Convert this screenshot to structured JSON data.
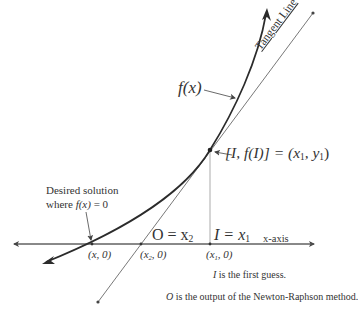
{
  "diagram": {
    "colors": {
      "curve": "#2b2b2b",
      "tangent": "#555555",
      "axis": "#444444",
      "text": "#333333"
    },
    "labels": {
      "curve_label": "f(x)",
      "tangent_label": "Tangent Line",
      "point_label_prefix": "[I, f(I)] = (x",
      "point_label_sub1": "1",
      "point_label_mid": ", y",
      "point_label_sub2": "1",
      "point_label_suffix": ")",
      "desired_line1": "Desired solution",
      "desired_line2_prefix": "where ",
      "desired_line2_fx": "f(x)",
      "desired_line2_suffix": " = 0",
      "o_label": "O = x",
      "o_sub": "2",
      "i_label": "I = x",
      "i_sub": "1",
      "x_axis_label": "x-axis",
      "root_coord": "(x, 0)",
      "x2_coord_prefix": "(x",
      "x2_coord_sub": "2",
      "x2_coord_suffix": ", 0)",
      "x1_coord_prefix": "(x",
      "x1_coord_sub": "1",
      "x1_coord_suffix": ", 0)",
      "note1_var": "I",
      "note1_text": " is the first guess.",
      "note2_var": "O",
      "note2_text": " is the output of the Newton-Raphson method."
    },
    "geometry": {
      "x_axis_y": 244,
      "x_axis_from": 12,
      "x_axis_to": 316,
      "root_x": 92,
      "x2": 141,
      "x1": 210,
      "tangent_point": [
        210,
        150
      ],
      "tangent_start": [
        98,
        302
      ],
      "tangent_end": [
        314,
        12
      ],
      "curve_start": [
        44,
        263
      ],
      "curve_end": [
        267,
        10
      ]
    }
  }
}
